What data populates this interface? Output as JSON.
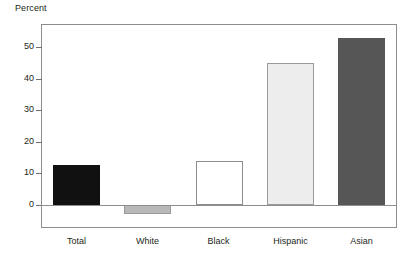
{
  "chart_data": {
    "type": "bar",
    "title": "",
    "subtitle": "",
    "xlabel": "",
    "ylabel": "Percent",
    "ylim": [
      -10,
      60
    ],
    "yticks": [
      0,
      10,
      20,
      30,
      40,
      50
    ],
    "ytick_labels": [
      "0",
      "10",
      "20",
      "30",
      "40",
      "50"
    ],
    "grid": false,
    "legend": false,
    "legend_position": "none",
    "categories": [
      "Total",
      "White",
      "Black",
      "Hispanic",
      "Asian"
    ],
    "values": [
      12.7,
      -3.0,
      14.0,
      45.0,
      53.0
    ],
    "value_labels": [
      "",
      "",
      "",
      "",
      ""
    ],
    "bar_colors": [
      "#111111",
      "#b8b8b8",
      "#ffffff",
      "#ededed",
      "#565656"
    ],
    "bar_edge_colors": [
      "#111111",
      "#9a9a9a",
      "#8d8d8d",
      "#9a9a9a",
      "#565656"
    ],
    "annotations": []
  },
  "axis": {
    "y_title": "Percent"
  }
}
